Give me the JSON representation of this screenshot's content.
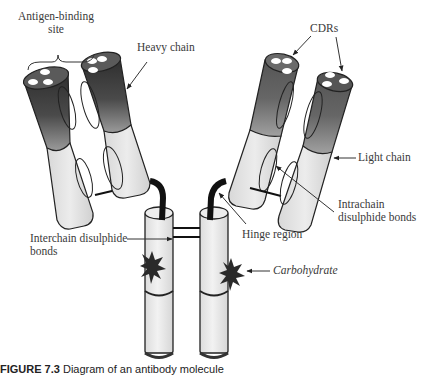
{
  "diagram": {
    "type": "antibody-structure",
    "labels": {
      "antigen_binding_site": "Antigen-binding\nsite",
      "antigen_binding_site_line1": "Antigen-binding",
      "antigen_binding_site_line2": "site",
      "heavy_chain": "Heavy chain",
      "cdrs": "CDRs",
      "light_chain": "Light chain",
      "intrachain_line1": "Intrachain",
      "intrachain_line2": "disulphide bonds",
      "hinge_region": "Hinge region",
      "interchain_line1": "Interchain disulphide",
      "interchain_line2": "bonds",
      "carbohydrate": "Carbohydrate"
    },
    "caption": {
      "figure_label": "FIGURE 7.3",
      "text": "Diagram of an antibody molecule"
    },
    "colors": {
      "dark_segment_top": "#3a3a3a",
      "dark_segment_bottom": "#8a8a8a",
      "light_segment": "#e4e4e4",
      "outline": "#222222",
      "hinge": "#111111",
      "carbohydrate": "#222222",
      "text": "#3a3a3a"
    }
  }
}
